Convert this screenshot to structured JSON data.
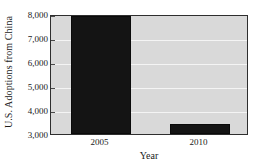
{
  "chart_data": {
    "type": "bar",
    "title": "",
    "subtitle": "",
    "categories": [
      "2005",
      "2010"
    ],
    "values": [
      7900,
      3400
    ],
    "series": [
      {
        "name": "U.S. Adoptions from China",
        "values": [
          7900,
          3400
        ]
      }
    ],
    "xlabel": "Year",
    "ylabel": "U.S. Adoptions from China",
    "ylim": [
      3000,
      8000
    ],
    "yticks": [
      3000,
      4000,
      5000,
      6000,
      7000,
      8000
    ],
    "ytick_labels": [
      "3,000",
      "4,000",
      "5,000",
      "6,000",
      "7,000",
      "8,000"
    ],
    "xtick_labels": [
      "2005",
      "2010"
    ],
    "grid": true,
    "grid_axis": "y",
    "legend": false,
    "legend_position": "none",
    "bar_color": "#141414",
    "plot_background_color": "#d9d9d9",
    "gridline_color": "#f4f4f4",
    "axis_color": "#2e2e2e",
    "figure_background_color": "#ffffff"
  }
}
